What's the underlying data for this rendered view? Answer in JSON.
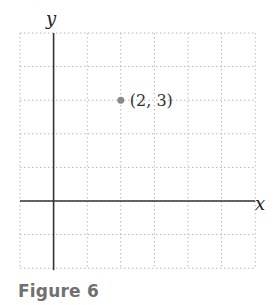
{
  "caption": "Figure 6",
  "chart_data": {
    "type": "scatter",
    "title": "",
    "xlabel": "x",
    "ylabel": "y",
    "xlim": [
      -1,
      6
    ],
    "ylim": [
      -2,
      5
    ],
    "grid": true,
    "points": [
      {
        "x": 2,
        "y": 3,
        "label": "(2, 3)"
      }
    ]
  },
  "colors": {
    "axis": "#333333",
    "grid": "#b8b8b8",
    "point": "#8a8a8a",
    "caption": "#707070"
  }
}
